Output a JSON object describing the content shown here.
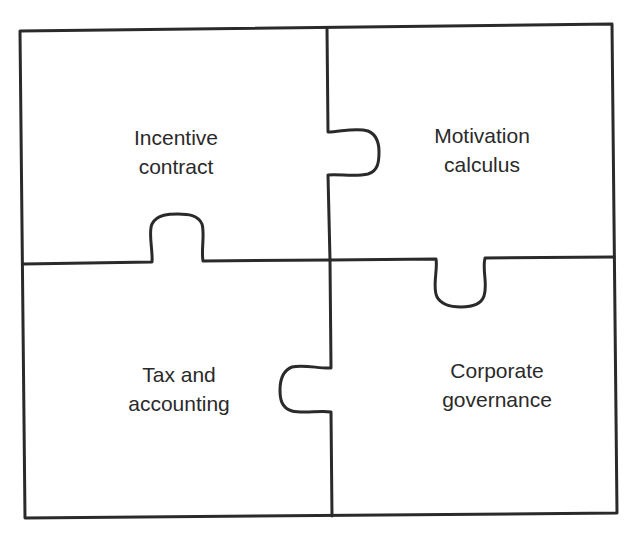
{
  "diagram": {
    "type": "jigsaw-puzzle",
    "pieces": [
      {
        "id": "top-left",
        "line1": "Incentive",
        "line2": "contract"
      },
      {
        "id": "top-right",
        "line1": "Motivation",
        "line2": "calculus"
      },
      {
        "id": "bottom-left",
        "line1": "Tax and",
        "line2": "accounting"
      },
      {
        "id": "bottom-right",
        "line1": "Corporate",
        "line2": "governance"
      }
    ],
    "colors": {
      "stroke": "#2a2a2a",
      "background": "#ffffff",
      "text": "#2a2a2a"
    }
  }
}
